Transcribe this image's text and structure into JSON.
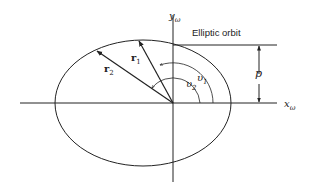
{
  "diagram": {
    "title": "Elliptic orbit",
    "labels": {
      "y_axis": "y",
      "y_axis_sub": "ω",
      "x_axis": "x",
      "x_axis_sub": "ω",
      "r1": "r",
      "r1_sub": "1",
      "r2": "r",
      "r2_sub": "2",
      "v1": "υ",
      "v1_sub": "1",
      "v2": "υ",
      "v2_sub": "2",
      "p": "p"
    },
    "colors": {
      "stroke": "#222222",
      "background": "#ffffff"
    }
  }
}
